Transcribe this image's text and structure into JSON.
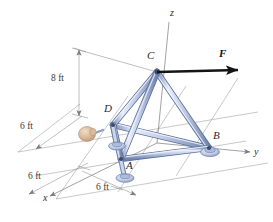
{
  "figure": {
    "type": "space-truss-free-body-diagram",
    "background_color": "#ffffff"
  },
  "axes": [
    {
      "name": "z",
      "label": "z",
      "label_x": 170,
      "label_y": 14
    },
    {
      "name": "y",
      "label": "y",
      "label_x": 254,
      "label_y": 153
    },
    {
      "name": "x",
      "label": "x",
      "label_x": 43,
      "label_y": 199
    }
  ],
  "nodes": [
    {
      "id": "C",
      "label": "C",
      "x": 157,
      "y": 72,
      "label_x": 147,
      "label_y": 57,
      "support": "none"
    },
    {
      "id": "D",
      "label": "D",
      "x": 113,
      "y": 125,
      "label_x": 106,
      "label_y": 110,
      "support": "ball-and-socket"
    },
    {
      "id": "A",
      "label": "A",
      "x": 121,
      "y": 159,
      "label_x": 125,
      "label_y": 164,
      "support": "ball-and-socket"
    },
    {
      "id": "B",
      "label": "B",
      "x": 209,
      "y": 148,
      "label_x": 214,
      "label_y": 136,
      "support": "ball-and-socket"
    }
  ],
  "force": {
    "label": "F",
    "label_x": 219,
    "label_y": 55,
    "direction": "+y",
    "applied_at": "C"
  },
  "dimensions": [
    {
      "id": "height-cz",
      "label": "8 ft",
      "label_x": 65,
      "label_y": 78,
      "orientation": "vertical",
      "value": 8,
      "unit": "ft"
    },
    {
      "id": "offset-left",
      "label": "6 ft",
      "label_x": 21,
      "label_y": 127,
      "orientation": "oblique",
      "value": 6,
      "unit": "ft"
    },
    {
      "id": "base-x-left",
      "label": "6 ft",
      "label_x": 29,
      "label_y": 177,
      "orientation": "oblique",
      "value": 6,
      "unit": "ft"
    },
    {
      "id": "base-x-right",
      "label": "6 ft",
      "label_x": 97,
      "label_y": 188,
      "orientation": "oblique",
      "value": 6,
      "unit": "ft"
    }
  ],
  "members": [
    {
      "from": "C",
      "to": "A"
    },
    {
      "from": "C",
      "to": "B"
    },
    {
      "from": "C",
      "to": "D"
    },
    {
      "from": "D",
      "to": "A"
    },
    {
      "from": "A",
      "to": "B"
    },
    {
      "from": "D",
      "to": "B"
    }
  ],
  "hand": {
    "name": "hand-grip",
    "x": 86,
    "y": 133,
    "color": "#d8b79a"
  },
  "colors": {
    "member_fill": "#c3cde6",
    "member_edge": "#5a6f9e",
    "member_highlight": "#eef2f9",
    "axis_line": "#8a8a8a",
    "grid_line": "#9a9a9a",
    "dimension_line": "#8a8a8a",
    "force_arrow": "#1a1a1a",
    "support_fill": "#b9c6e0",
    "support_edge": "#6b7fae",
    "label_text": "#2b2b2b"
  }
}
